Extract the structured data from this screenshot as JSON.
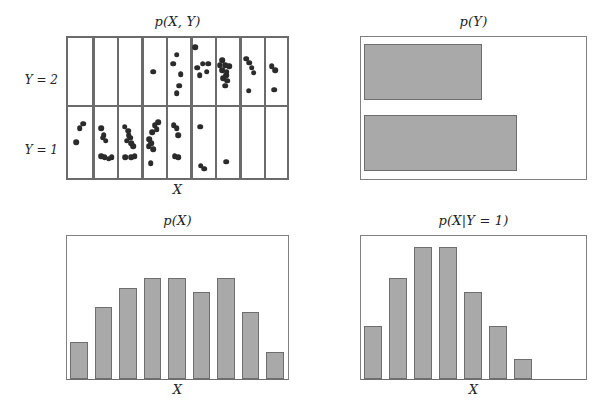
{
  "figure": {
    "caption_panels": 4,
    "dot_color": "#2b2b2b",
    "bar_fill": "#a9a9a9",
    "bar_stroke": "#6e6e6e",
    "grid_stroke": "#6b6b6b"
  },
  "panels": {
    "joint": {
      "title": "p(X, Y)",
      "xlabel": "X",
      "row_labels": [
        "Y = 2",
        "Y = 1"
      ],
      "columns": 9
    },
    "marginal_y": {
      "title": "p(Y)",
      "xlabel": ""
    },
    "marginal_x": {
      "title": "p(X)",
      "xlabel": "X"
    },
    "conditional_x": {
      "title": "p(X|Y = 1)",
      "xlabel": "X"
    }
  },
  "chart_data": [
    {
      "type": "scatter",
      "name": "joint-distribution-grid",
      "title": "p(X, Y)",
      "xlabel": "X",
      "ylabel": "",
      "grid": true,
      "columns": 9,
      "rows": [
        "Y = 2",
        "Y = 1"
      ],
      "counts_y2": [
        0,
        0,
        0,
        1,
        5,
        6,
        10,
        5,
        3
      ],
      "counts_y1": [
        3,
        8,
        10,
        9,
        5,
        3,
        1,
        0,
        0
      ],
      "points_y2": [
        [
          3.45,
          0.52
        ],
        [
          4.42,
          0.26
        ],
        [
          4.28,
          0.4
        ],
        [
          4.6,
          0.56
        ],
        [
          4.52,
          0.74
        ],
        [
          4.42,
          0.86
        ],
        [
          5.2,
          0.14
        ],
        [
          5.28,
          0.46
        ],
        [
          5.5,
          0.4
        ],
        [
          5.66,
          0.52
        ],
        [
          5.38,
          0.58
        ],
        [
          5.74,
          0.4
        ],
        [
          6.3,
          0.34
        ],
        [
          6.42,
          0.42
        ],
        [
          6.3,
          0.5
        ],
        [
          6.5,
          0.52
        ],
        [
          6.34,
          0.62
        ],
        [
          6.52,
          0.66
        ],
        [
          6.42,
          0.74
        ],
        [
          6.6,
          0.44
        ],
        [
          6.2,
          0.42
        ],
        [
          6.46,
          0.58
        ],
        [
          7.3,
          0.32
        ],
        [
          7.42,
          0.38
        ],
        [
          7.52,
          0.46
        ],
        [
          7.6,
          0.54
        ],
        [
          7.4,
          0.82
        ],
        [
          8.35,
          0.44
        ],
        [
          8.5,
          0.5
        ],
        [
          8.45,
          0.8
        ]
      ],
      "points_y1": [
        [
          0.42,
          0.3
        ],
        [
          0.56,
          0.24
        ],
        [
          0.28,
          0.5
        ],
        [
          1.3,
          0.3
        ],
        [
          1.42,
          0.4
        ],
        [
          1.5,
          0.48
        ],
        [
          1.3,
          0.7
        ],
        [
          1.46,
          0.72
        ],
        [
          1.62,
          0.74
        ],
        [
          1.74,
          0.72
        ],
        [
          1.38,
          0.44
        ],
        [
          2.28,
          0.28
        ],
        [
          2.42,
          0.34
        ],
        [
          2.5,
          0.44
        ],
        [
          2.36,
          0.48
        ],
        [
          2.54,
          0.52
        ],
        [
          2.62,
          0.56
        ],
        [
          2.3,
          0.72
        ],
        [
          2.56,
          0.72
        ],
        [
          2.7,
          0.7
        ],
        [
          2.44,
          0.4
        ],
        [
          3.3,
          0.46
        ],
        [
          3.42,
          0.36
        ],
        [
          3.52,
          0.26
        ],
        [
          3.6,
          0.32
        ],
        [
          3.38,
          0.52
        ],
        [
          3.28,
          0.56
        ],
        [
          3.46,
          0.6
        ],
        [
          3.36,
          0.8
        ],
        [
          3.66,
          0.22
        ],
        [
          4.3,
          0.26
        ],
        [
          4.42,
          0.3
        ],
        [
          4.5,
          0.4
        ],
        [
          4.34,
          0.7
        ],
        [
          4.48,
          0.72
        ],
        [
          5.4,
          0.28
        ],
        [
          5.42,
          0.84
        ],
        [
          5.56,
          0.88
        ],
        [
          6.46,
          0.78
        ]
      ]
    },
    {
      "type": "bar",
      "orientation": "horizontal",
      "name": "marginal-y",
      "title": "p(Y)",
      "categories": [
        "Y = 2",
        "Y = 1"
      ],
      "values": [
        0.54,
        0.7
      ],
      "xlim": [
        0,
        1
      ],
      "grid": false
    },
    {
      "type": "bar",
      "name": "marginal-x",
      "title": "p(X)",
      "xlabel": "X",
      "ylabel": "",
      "categories": [
        "1",
        "2",
        "3",
        "4",
        "5",
        "6",
        "7",
        "8",
        "9"
      ],
      "values": [
        0.26,
        0.51,
        0.64,
        0.71,
        0.71,
        0.61,
        0.71,
        0.47,
        0.19
      ],
      "ylim": [
        0,
        1
      ],
      "grid": false
    },
    {
      "type": "bar",
      "name": "conditional-x-given-y1",
      "title": "p(X|Y = 1)",
      "xlabel": "X",
      "ylabel": "",
      "categories": [
        "1",
        "2",
        "3",
        "4",
        "5",
        "6",
        "7",
        "8",
        "9"
      ],
      "values": [
        0.37,
        0.71,
        0.93,
        0.93,
        0.61,
        0.37,
        0.14,
        0,
        0
      ],
      "ylim": [
        0,
        1
      ],
      "grid": false
    }
  ]
}
